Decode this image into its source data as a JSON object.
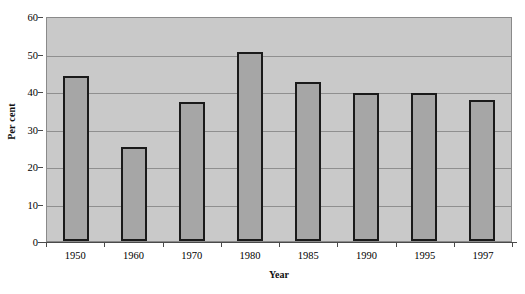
{
  "chart_data": {
    "type": "bar",
    "title": "",
    "subtitle": "",
    "xlabel": "Year",
    "ylabel": "Per cent",
    "categories": [
      "1950",
      "1960",
      "1970",
      "1980",
      "1985",
      "1990",
      "1995",
      "1997"
    ],
    "values": [
      44,
      25,
      37,
      50.3,
      42.3,
      39.5,
      39.5,
      37.5
    ],
    "series": [
      {
        "name": "Per cent",
        "values": [
          44,
          25,
          37,
          50.3,
          42.3,
          39.5,
          39.5,
          37.5
        ]
      }
    ],
    "ylim": [
      0,
      60
    ],
    "yticks": [
      0,
      10,
      20,
      30,
      40,
      50,
      60
    ],
    "ytick_labels": [
      "0",
      "10",
      "20",
      "30",
      "40",
      "50",
      "60"
    ],
    "grid": true,
    "grid_axis": "y",
    "legend": "none",
    "colors": {
      "bar_fill": "#a6a6a6",
      "bar_edge": "#1a1a1a",
      "plot_background": "#c9c9c9",
      "gridline": "#8f8f8f",
      "axis": "#4a4a4a",
      "text": "#000000",
      "figure_background": "#ffffff"
    }
  }
}
